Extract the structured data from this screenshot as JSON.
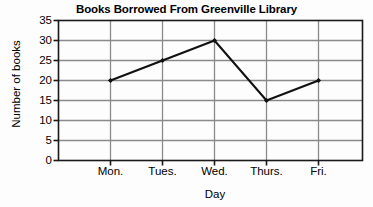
{
  "chart_data": {
    "type": "line",
    "title": "Books Borrowed From Greenville Library",
    "xlabel": "Day",
    "ylabel": "Number of books",
    "categories": [
      "Mon.",
      "Tues.",
      "Wed.",
      "Thurs.",
      "Fri."
    ],
    "values": [
      20,
      25,
      30,
      15,
      20
    ],
    "series": [
      {
        "name": "Books borrowed",
        "values": [
          20,
          25,
          30,
          15,
          20
        ]
      }
    ],
    "ylim": [
      0,
      35
    ],
    "ytick_step": 5,
    "yticks": [
      0,
      5,
      10,
      15,
      20,
      25,
      30,
      35
    ],
    "ytick_labels": [
      "0",
      "5",
      "10",
      "15",
      "20",
      "25",
      "30",
      "35"
    ],
    "grid": true,
    "grid_axis": "both",
    "legend": false,
    "legend_position": "none",
    "marker": "filled-diamond",
    "colors": {
      "line": "#111111",
      "marker": "#111111",
      "grid": "#8a8a8a",
      "axis": "#1a1a1a",
      "background": "#fdfdfd",
      "plot_background": "#ffffff",
      "text": "#000000"
    }
  }
}
